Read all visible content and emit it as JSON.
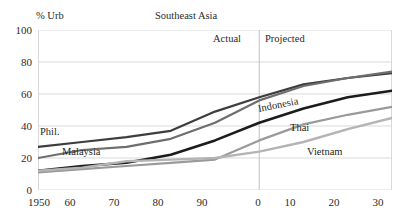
{
  "chart": {
    "title": "Southeast Asia",
    "y_axis_title": "% Urb",
    "actual_label": "Actual",
    "projected_label": "Projected"
  },
  "axes": {
    "y_ticks": [
      "0",
      "20",
      "40",
      "60",
      "80",
      "100"
    ],
    "x_ticks": [
      "1950",
      "60",
      "70",
      "80",
      "90",
      "0",
      "10",
      "20",
      "30"
    ]
  },
  "series_labels": {
    "philippines": "Phil.",
    "malaysia": "Malaysia",
    "indonesia": "Indonesia",
    "thailand": "Thai",
    "vietnam": "Vietnam"
  },
  "colors": {
    "philippines": "#3d3d3d",
    "malaysia": "#6e6e6e",
    "indonesia": "#1c1c1c",
    "thailand": "#9a9a9a",
    "vietnam": "#b4b4b4",
    "gridline": "#d9d9d9",
    "divider": "#c2c2c2",
    "text": "#2a2a2a"
  },
  "chart_data": {
    "type": "line",
    "title": "Southeast Asia",
    "xlabel": "",
    "ylabel": "% Urb",
    "xlim": [
      1950,
      2030
    ],
    "ylim": [
      0,
      100
    ],
    "grid": true,
    "legend": "inline-labels",
    "annotations": [
      {
        "text": "Actual",
        "x": 1990,
        "y": 92
      },
      {
        "text": "Projected",
        "x": 2005,
        "y": 92
      },
      {
        "text": "divider",
        "x": 2000,
        "y": null
      }
    ],
    "x": [
      1950,
      1960,
      1970,
      1980,
      1990,
      2000,
      2010,
      2020,
      2030
    ],
    "series": [
      {
        "name": "Phil.",
        "values": [
          27,
          30,
          33,
          37,
          49,
          58,
          66,
          70,
          73
        ]
      },
      {
        "name": "Malaysia",
        "values": [
          20,
          25,
          27,
          32,
          42,
          56,
          65,
          70,
          74
        ]
      },
      {
        "name": "Indonesia",
        "values": [
          12,
          15,
          17,
          22,
          31,
          42,
          51,
          58,
          62
        ]
      },
      {
        "name": "Thai",
        "values": [
          11,
          13,
          15,
          17,
          19,
          31,
          41,
          47,
          52
        ]
      },
      {
        "name": "Vietnam",
        "values": [
          12,
          14,
          18,
          19,
          20,
          24,
          30,
          38,
          45
        ]
      }
    ]
  }
}
